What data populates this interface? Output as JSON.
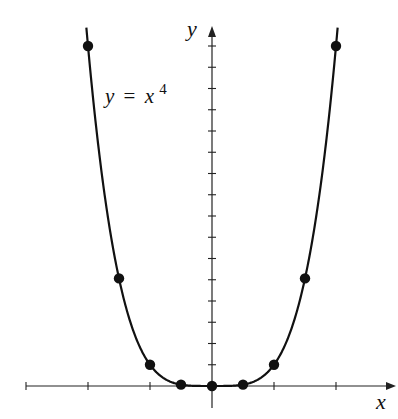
{
  "chart_data": {
    "type": "line",
    "title": "",
    "annotation": "y = x^4",
    "annotation_parts": {
      "lhs": "y",
      "eq": "=",
      "base": "x",
      "exp": "4"
    },
    "xlabel": "x",
    "ylabel": "y",
    "xlim": [
      -3,
      3
    ],
    "ylim": [
      0,
      17
    ],
    "grid": false,
    "legend": null,
    "x_ticks": [
      -3,
      -2,
      -1,
      1,
      2
    ],
    "y_ticks": [
      1,
      2,
      3,
      4,
      5,
      6,
      7,
      8,
      9,
      10,
      11,
      12,
      13,
      14,
      15,
      16
    ],
    "tick_labels_shown": false,
    "series": [
      {
        "name": "y = x^4",
        "kind": "curve",
        "function": "x^4",
        "domain": [
          -2.1,
          2.1
        ],
        "color": "#111111"
      },
      {
        "name": "plotted points",
        "kind": "scatter",
        "x": [
          -2,
          -1.5,
          -1,
          -0.5,
          0,
          0.5,
          1,
          1.5,
          2
        ],
        "y": [
          16,
          5.0625,
          1,
          0.0625,
          0,
          0.0625,
          1,
          5.0625,
          16
        ],
        "color": "#111111"
      }
    ]
  }
}
